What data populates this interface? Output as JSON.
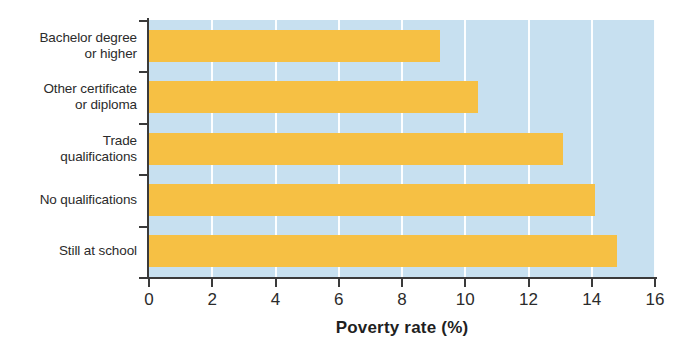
{
  "chart_data": {
    "type": "bar",
    "orientation": "horizontal",
    "title": "",
    "xlabel": "Poverty rate (%)",
    "ylabel": "",
    "xlim": [
      0,
      16
    ],
    "xticks": [
      "0",
      "2",
      "4",
      "6",
      "8",
      "10",
      "12",
      "14",
      "16"
    ],
    "grid": true,
    "legend": "none",
    "categories": [
      "Bachelor degree\nor higher",
      "Other certificate\nor diploma",
      "Trade\nqualifications",
      "No qualifications",
      "Still at school"
    ],
    "values": [
      9.2,
      10.4,
      13.1,
      14.1,
      14.8
    ],
    "colors": {
      "bar": "#f6c044",
      "plot_background": "#c7e0f0",
      "gridline": "#ffffff",
      "axis": "#3a3a3a",
      "text": "#2b2b2b",
      "page_background": "#ffffff"
    }
  }
}
